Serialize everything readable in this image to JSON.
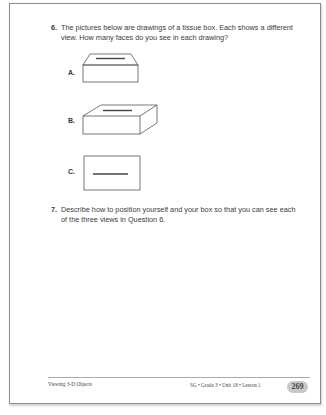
{
  "question6": {
    "number": "6.",
    "text": "The pictures below are drawings of a tissue box. Each shows a different view. How many faces do you see in each drawing?",
    "figures": [
      {
        "label": "A.",
        "description": "tissue box viewed from front and top"
      },
      {
        "label": "B.",
        "description": "tissue box viewed from front, top and right side"
      },
      {
        "label": "C.",
        "description": "tissue box viewed directly from top"
      }
    ]
  },
  "question7": {
    "number": "7.",
    "text": "Describe how to position yourself and your box so that you can see each of the three views in Question 6."
  },
  "footer": {
    "left": "Viewing 3-D Objects",
    "right": "SG • Grade 3 • Unit 18 • Lesson 1",
    "page_number": "269"
  }
}
